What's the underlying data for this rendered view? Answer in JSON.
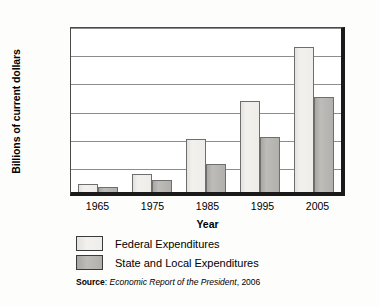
{
  "chart_data": {
    "type": "bar",
    "title": "",
    "xlabel": "Year",
    "ylabel": "Billions of current dollars",
    "categories": [
      "1965",
      "1975",
      "1985",
      "1995",
      "2005"
    ],
    "series": [
      {
        "name": "Federal Expenditures",
        "values": [
          145,
          320,
          946,
          1620,
          2570
        ],
        "color": "#efedea"
      },
      {
        "name": "State and Local Expenditures",
        "values": [
          85,
          215,
          505,
          985,
          1680
        ],
        "color": "#b2b0ac"
      }
    ],
    "ylim": [
      0,
      3000
    ],
    "yticks": [
      0,
      500,
      1000,
      1500,
      2000,
      2500,
      3000
    ],
    "ytick_labels": [
      "0",
      "500",
      "1,000",
      "1,500",
      "2,000",
      "2,500",
      "3,000"
    ],
    "grid": true,
    "legend_position": "below"
  },
  "source": {
    "label": "Source",
    "separator": ": ",
    "title": "Economic Report of the President",
    "year": ", 2006"
  }
}
